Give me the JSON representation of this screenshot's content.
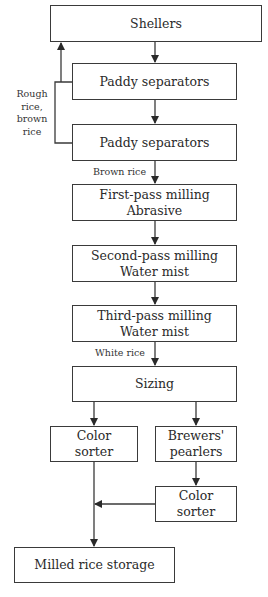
{
  "diagram": {
    "type": "flowchart",
    "nodes": {
      "shellers": {
        "line1": "Shellers"
      },
      "paddy_sep_1": {
        "line1": "Paddy separators"
      },
      "paddy_sep_2": {
        "line1": "Paddy separators"
      },
      "first_pass": {
        "line1": "First-pass milling",
        "line2": "Abrasive"
      },
      "second_pass": {
        "line1": "Second-pass milling",
        "line2": "Water mist"
      },
      "third_pass": {
        "line1": "Third-pass milling",
        "line2": "Water mist"
      },
      "sizing": {
        "line1": "Sizing"
      },
      "color_sorter_1": {
        "line1": "Color",
        "line2": "sorter"
      },
      "brewers_pearlers": {
        "line1": "Brewers'",
        "line2": "pearlers"
      },
      "color_sorter_2": {
        "line1": "Color",
        "line2": "sorter"
      },
      "milled_storage": {
        "line1": "Milled rice storage"
      }
    },
    "edge_labels": {
      "recycle": {
        "line1": "Rough",
        "line2": "rice,",
        "line3": "brown",
        "line4": "rice"
      },
      "brown_rice": "Brown rice",
      "white_rice": "White rice"
    },
    "edges": [
      {
        "from": "shellers",
        "to": "paddy_sep_1"
      },
      {
        "from": "paddy_sep_1",
        "to": "paddy_sep_2"
      },
      {
        "from": "paddy_sep_1",
        "to": "shellers",
        "label": "Rough rice, brown rice"
      },
      {
        "from": "paddy_sep_2",
        "to": "shellers",
        "label": "Rough rice, brown rice"
      },
      {
        "from": "paddy_sep_2",
        "to": "first_pass",
        "label": "Brown rice"
      },
      {
        "from": "first_pass",
        "to": "second_pass"
      },
      {
        "from": "second_pass",
        "to": "third_pass"
      },
      {
        "from": "third_pass",
        "to": "sizing",
        "label": "White rice"
      },
      {
        "from": "sizing",
        "to": "color_sorter_1"
      },
      {
        "from": "sizing",
        "to": "brewers_pearlers"
      },
      {
        "from": "brewers_pearlers",
        "to": "color_sorter_2"
      },
      {
        "from": "color_sorter_2",
        "to": "milled_storage"
      },
      {
        "from": "color_sorter_1",
        "to": "milled_storage"
      }
    ]
  }
}
